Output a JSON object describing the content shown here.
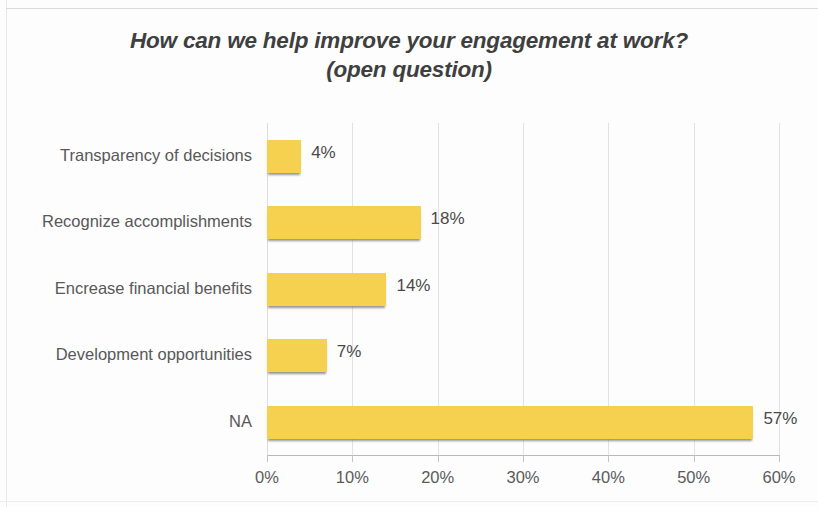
{
  "chart_data": {
    "type": "bar",
    "orientation": "horizontal",
    "title": "How can we help improve your engagement at work?",
    "subtitle": "(open question)",
    "title_line1": "How can we help improve your engagement at work?",
    "title_line2": "(open question)",
    "xlabel": "",
    "ylabel": "",
    "categories": [
      "Transparency of decisions",
      "Recognize accomplishments",
      "Encrease financial benefits",
      "Development opportunities",
      "NA"
    ],
    "values": [
      4,
      18,
      14,
      7,
      57
    ],
    "data_labels": [
      "4%",
      "18%",
      "14%",
      "7%",
      "57%"
    ],
    "xlim": [
      0,
      60
    ],
    "xtick_values": [
      0,
      10,
      20,
      30,
      40,
      50,
      60
    ],
    "xtick_labels": [
      "0%",
      "10%",
      "20%",
      "30%",
      "40%",
      "50%",
      "60%"
    ],
    "grid": true,
    "grid_axis": "x",
    "legend": false,
    "bar_color": "#f5d14f",
    "text_color": "#585858",
    "title_color": "#3f3f3f",
    "gridline_color": "#e2e2e2",
    "background": "#fdfdfd"
  }
}
